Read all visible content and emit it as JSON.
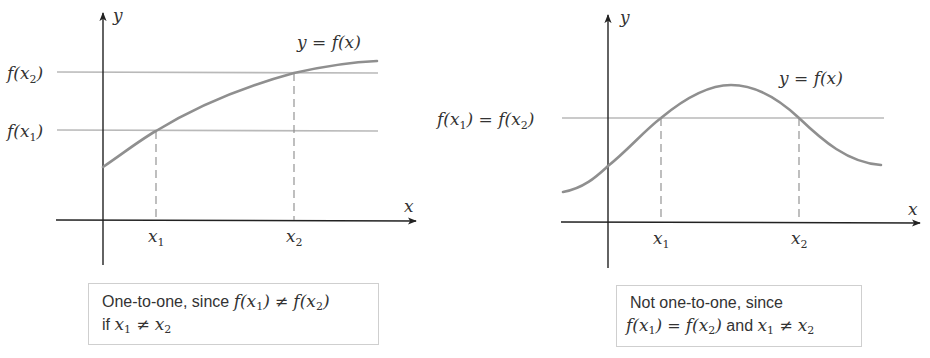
{
  "panels": [
    {
      "id": "left",
      "axis_labels": {
        "x": "x",
        "y": "y"
      },
      "function_label": "y = f(x)",
      "y_ref_labels": [
        {
          "base": "f(x",
          "sub": "2",
          "close": ")"
        },
        {
          "base": "f(x",
          "sub": "1",
          "close": ")"
        }
      ],
      "x_tick_labels": [
        {
          "base": "x",
          "sub": "1"
        },
        {
          "base": "x",
          "sub": "2"
        }
      ],
      "caption": {
        "line1_text": "One-to-one, since ",
        "line1_math_a": "f(x",
        "line1_sub_a": "1",
        "line1_math_a_close": ")",
        "line1_op": " ≠ ",
        "line1_math_b": "f(x",
        "line1_sub_b": "2",
        "line1_math_b_close": ")",
        "line2_text": "if ",
        "line2_var_a": "x",
        "line2_sub_a": "1",
        "line2_op": " ≠ ",
        "line2_var_b": "x",
        "line2_sub_b": "2"
      }
    },
    {
      "id": "right",
      "axis_labels": {
        "x": "x",
        "y": "y"
      },
      "function_label": "y = f(x)",
      "y_ref_label": {
        "a_base": "f(x",
        "a_sub": "1",
        "a_close": ")",
        "eq": " = ",
        "b_base": "f(x",
        "b_sub": "2",
        "b_close": ")"
      },
      "x_tick_labels": [
        {
          "base": "x",
          "sub": "1"
        },
        {
          "base": "x",
          "sub": "2"
        }
      ],
      "caption": {
        "line1_text": "Not one-to-one, since",
        "line2_math_a": "f(x",
        "line2_sub_a": "1",
        "line2_math_a_close": ")",
        "line2_eq": " = ",
        "line2_math_b": "f(x",
        "line2_sub_b": "2",
        "line2_math_b_close": ")",
        "line2_and": " and ",
        "line2_var_a": "x",
        "line2_sub_c": "1",
        "line2_op": " ≠ ",
        "line2_var_b": "x",
        "line2_sub_d": "2"
      }
    }
  ],
  "colors": {
    "axis": "#222222",
    "curve": "#8f8f8f",
    "reference_line": "#b9b9b9",
    "dashed_line": "#8a8a8a",
    "caption_border": "#cfcfcf"
  }
}
